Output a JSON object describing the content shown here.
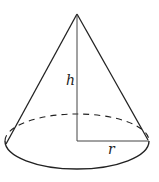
{
  "diagram": {
    "type": "cone",
    "labels": {
      "height": "h",
      "radius": "r"
    },
    "colors": {
      "stroke": "#222222",
      "background": "#ffffff"
    }
  }
}
